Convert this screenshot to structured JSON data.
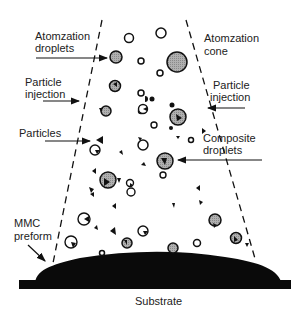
{
  "labels": {
    "atomization_droplets_1": "Atomzation",
    "atomization_droplets_2": "droplets",
    "atomization_cone_1": "Atomzation",
    "atomization_cone_2": "cone",
    "particle_injection_left_1": "Particle",
    "particle_injection_left_2": "injection",
    "particle_injection_right_1": "Particle",
    "particle_injection_right_2": "injection",
    "particles": "Particles",
    "composite_droplets_1": "Composite",
    "composite_droplets_2": "droplets",
    "mmc_preform_1": "MMC",
    "mmc_preform_2": "preform",
    "substrate": "Substrate"
  },
  "colors": {
    "ink": "#111111",
    "droplet_fill": "#a8a8a8",
    "background": "#ffffff"
  }
}
